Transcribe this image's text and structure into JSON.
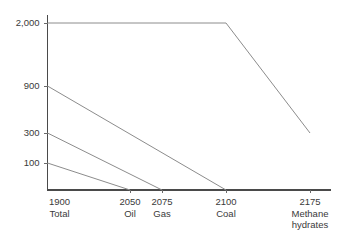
{
  "chart_data": {
    "type": "line",
    "title": "",
    "subtitle": "",
    "xlabel": "",
    "ylabel": "",
    "grid": false,
    "legend": "none",
    "background_color": "#ffffff",
    "line_color": "#8c8c8c",
    "axis_color": "#4a4a4a",
    "x": [
      1900,
      2050,
      2075,
      2100,
      2175
    ],
    "xlim": [
      1900,
      2175
    ],
    "ylim": [
      0,
      2000
    ],
    "y_scale": "compressed",
    "y_ticks": [
      2000,
      900,
      300,
      100
    ],
    "y_tick_labels": [
      "2,000",
      "900",
      "300",
      "100"
    ],
    "x_tick_years": [
      "1900",
      "2050",
      "2075",
      "2100",
      "2175"
    ],
    "x_tick_names": [
      "Total",
      "Oil",
      "Gas",
      "Coal",
      "Methane hydrates"
    ],
    "x_tick_name_lines": [
      [
        "Total"
      ],
      [
        "Oil"
      ],
      [
        "Gas"
      ],
      [
        "Coal"
      ],
      [
        "Methane",
        "hydrates"
      ]
    ],
    "series": [
      {
        "name": "Total",
        "start_value": 2000,
        "points": [
          {
            "x": 1900,
            "y": 2000
          },
          {
            "x": 2100,
            "y": 2000
          },
          {
            "x": 2175,
            "y": 300
          }
        ]
      },
      {
        "name": "Coal",
        "start_value": 900,
        "points": [
          {
            "x": 1900,
            "y": 900
          },
          {
            "x": 2100,
            "y": 0
          }
        ]
      },
      {
        "name": "Gas",
        "start_value": 300,
        "points": [
          {
            "x": 1900,
            "y": 300
          },
          {
            "x": 2075,
            "y": 0
          }
        ]
      },
      {
        "name": "Oil",
        "start_value": 100,
        "points": [
          {
            "x": 1900,
            "y": 100
          },
          {
            "x": 2050,
            "y": 0
          }
        ]
      }
    ]
  }
}
